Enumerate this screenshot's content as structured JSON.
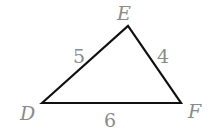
{
  "diagram": {
    "type": "triangle",
    "vertices": [
      {
        "name": "D",
        "x": 42,
        "y": 103
      },
      {
        "name": "E",
        "x": 128,
        "y": 26
      },
      {
        "name": "F",
        "x": 181,
        "y": 103
      }
    ],
    "sides": [
      {
        "from": "D",
        "to": "E",
        "label": "5"
      },
      {
        "from": "E",
        "to": "F",
        "label": "4"
      },
      {
        "from": "D",
        "to": "F",
        "label": "6"
      }
    ],
    "colors": {
      "line": "#111111",
      "label": "#8a8a8a"
    }
  }
}
